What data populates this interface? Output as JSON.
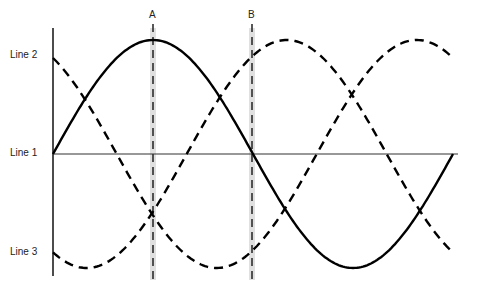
{
  "diagram": {
    "type": "sine-wave-phase-diagram",
    "markers": [
      {
        "label": "A",
        "x": 153
      },
      {
        "label": "B",
        "x": 252
      }
    ],
    "y_labels": [
      {
        "label": "Line 2",
        "y": 58
      },
      {
        "label": "Line 1",
        "y": 154
      },
      {
        "label": "Line 3",
        "y": 253
      }
    ],
    "curves": [
      {
        "name": "solid-wave",
        "style": "solid",
        "phase": 0
      },
      {
        "name": "dashed-wave-1",
        "style": "dashed",
        "phase": 2.14
      },
      {
        "name": "dashed-wave-2",
        "style": "dashed",
        "phase": -2.1
      }
    ],
    "colors": {
      "line": "#000000",
      "marker_band": "#dcdcdc"
    }
  }
}
